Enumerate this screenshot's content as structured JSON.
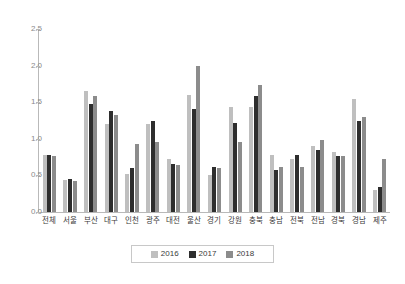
{
  "chart_data": {
    "type": "bar",
    "title": "",
    "subtitle": "",
    "xlabel": "",
    "ylabel": "",
    "ylim": [
      0.0,
      2.5
    ],
    "ytick_labels": [
      "0.0",
      "0.5",
      "1.0",
      "1.5",
      "2.0",
      "2.5"
    ],
    "ytick_values": [
      0.0,
      0.5,
      1.0,
      1.5,
      2.0,
      2.5
    ],
    "grid": false,
    "legend_position": "bottom",
    "categories": [
      "전체",
      "서울",
      "부산",
      "대구",
      "인천",
      "광주",
      "대전",
      "울산",
      "경기",
      "강원",
      "충북",
      "충남",
      "전북",
      "전남",
      "경북",
      "경남",
      "제주"
    ],
    "series": [
      {
        "name": "2016",
        "color": "#bfbfbf",
        "values": [
          0.78,
          0.44,
          1.65,
          1.2,
          0.52,
          1.2,
          0.72,
          1.6,
          0.51,
          1.44,
          1.44,
          0.78,
          0.73,
          0.9,
          0.82,
          1.54,
          0.3
        ]
      },
      {
        "name": "2017",
        "color": "#2e2e2e",
        "values": [
          0.78,
          0.45,
          1.47,
          1.38,
          0.6,
          1.24,
          0.66,
          1.41,
          0.62,
          1.22,
          1.59,
          0.58,
          0.78,
          0.85,
          0.76,
          1.24,
          0.34
        ]
      },
      {
        "name": "2018",
        "color": "#8c8c8c",
        "values": [
          0.77,
          0.42,
          1.58,
          1.32,
          0.93,
          0.95,
          0.64,
          2.0,
          0.6,
          0.95,
          1.74,
          0.62,
          0.61,
          0.99,
          0.76,
          1.3,
          0.73
        ]
      }
    ]
  },
  "legend": {
    "items": [
      {
        "label": "2016",
        "swatch": "swatch-2016"
      },
      {
        "label": "2017",
        "swatch": "swatch-2017"
      },
      {
        "label": "2018",
        "swatch": "swatch-2018"
      }
    ]
  },
  "colors": {
    "series_2016": "#bfbfbf",
    "series_2017": "#2e2e2e",
    "series_2018": "#8c8c8c",
    "axis": "#b9b9b9",
    "tick_text": "#8a8a8a",
    "label_text": "#3a3a3a",
    "background": "#ffffff"
  }
}
